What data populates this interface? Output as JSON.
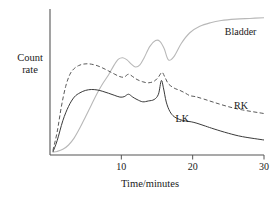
{
  "chart_data": {
    "type": "line",
    "title": "",
    "xlabel": "Time/minutes",
    "ylabel": "Count rate",
    "xlim": [
      0,
      30
    ],
    "ylim": [
      0,
      1
    ],
    "grid": false,
    "legend_position": "inline-annotations",
    "xticks": [
      10,
      20,
      30
    ],
    "xticklabels": [
      "10",
      "20",
      "30"
    ],
    "yticks": [],
    "yticklabels": [],
    "series": [
      {
        "name": "Bladder",
        "style": "solid-light",
        "color": "#b8b8b8",
        "label_x": 24.5,
        "label_y": 0.86,
        "x": [
          0.4,
          1.0,
          1.8,
          2.6,
          3.4,
          4.2,
          5.0,
          5.8,
          6.6,
          7.4,
          8.2,
          9.0,
          9.6,
          10.2,
          10.8,
          11.4,
          12.0,
          12.6,
          13.2,
          14.0,
          14.8,
          15.4,
          16.0,
          16.6,
          17.4,
          18.4,
          19.6,
          21.0,
          22.5,
          24.0,
          26.0,
          28.0,
          30.0
        ],
        "y": [
          0.02,
          0.025,
          0.04,
          0.07,
          0.12,
          0.19,
          0.27,
          0.35,
          0.43,
          0.5,
          0.56,
          0.63,
          0.67,
          0.68,
          0.665,
          0.635,
          0.615,
          0.63,
          0.68,
          0.76,
          0.8,
          0.795,
          0.745,
          0.665,
          0.69,
          0.78,
          0.855,
          0.9,
          0.925,
          0.94,
          0.95,
          0.955,
          0.96
        ]
      },
      {
        "name": "RK",
        "style": "dashed",
        "color": "#5a5a5a",
        "label_x": 25.8,
        "label_y": 0.345,
        "x": [
          0.4,
          1.0,
          1.6,
          2.2,
          2.8,
          3.4,
          4.0,
          4.6,
          5.2,
          5.8,
          6.6,
          7.4,
          8.2,
          9.0,
          9.8,
          10.4,
          11.0,
          11.6,
          12.2,
          13.0,
          13.8,
          14.6,
          15.2,
          15.7,
          16.1,
          16.6,
          17.4,
          18.2,
          19.0,
          19.6,
          20.4,
          21.5,
          23.0,
          25.0,
          27.0,
          30.0
        ],
        "y": [
          0.03,
          0.16,
          0.34,
          0.48,
          0.565,
          0.605,
          0.625,
          0.635,
          0.638,
          0.635,
          0.625,
          0.608,
          0.588,
          0.567,
          0.548,
          0.545,
          0.565,
          0.548,
          0.528,
          0.512,
          0.505,
          0.516,
          0.545,
          0.578,
          0.545,
          0.498,
          0.468,
          0.452,
          0.432,
          0.415,
          0.408,
          0.392,
          0.368,
          0.338,
          0.315,
          0.29
        ]
      },
      {
        "name": "LK",
        "style": "solid",
        "color": "#3a3a3a",
        "label_x": 17.6,
        "label_y": 0.255,
        "x": [
          0.4,
          1.0,
          1.8,
          2.6,
          3.4,
          4.2,
          5.0,
          5.8,
          6.6,
          7.4,
          8.2,
          9.0,
          9.8,
          10.4,
          11.0,
          11.6,
          12.2,
          13.0,
          13.8,
          14.6,
          15.2,
          15.6,
          15.9,
          16.3,
          16.8,
          17.4,
          18.2,
          19.0,
          19.8,
          20.6,
          21.8,
          23.0,
          25.0,
          27.0,
          30.0
        ],
        "y": [
          0.02,
          0.1,
          0.24,
          0.34,
          0.405,
          0.435,
          0.452,
          0.458,
          0.455,
          0.445,
          0.432,
          0.418,
          0.405,
          0.408,
          0.425,
          0.405,
          0.388,
          0.372,
          0.378,
          0.388,
          0.425,
          0.52,
          0.47,
          0.37,
          0.305,
          0.268,
          0.248,
          0.238,
          0.232,
          0.222,
          0.202,
          0.182,
          0.152,
          0.128,
          0.105
        ]
      }
    ]
  },
  "axes": {
    "y_label_line1": "Count",
    "y_label_line2": "rate",
    "x_label": "Time/minutes"
  }
}
